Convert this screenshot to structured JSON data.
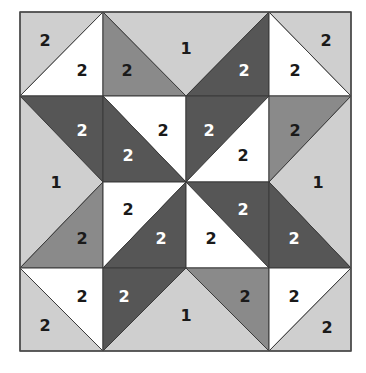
{
  "diagram": {
    "colors": {
      "light": "#cfcfcf",
      "white": "#ffffff",
      "medium": "#8a8a8a",
      "dark": "#565656",
      "text_dark": "#1a1a1a",
      "text_light": "#ffffff"
    },
    "grid": {
      "x": [
        20,
        103,
        186,
        269,
        351
      ],
      "y": [
        12,
        96,
        182,
        268,
        351
      ]
    },
    "pieces": [
      {
        "id": "tl-corner-light",
        "tone": "light",
        "points": "20,12 103,12 20,96",
        "label": "2",
        "lx": 45,
        "ly": 40
      },
      {
        "id": "tl-corner-white",
        "tone": "white",
        "points": "103,12 103,96 20,96",
        "label": "2",
        "lx": 82,
        "ly": 70
      },
      {
        "id": "top-mid-medium",
        "tone": "medium",
        "points": "103,12 103,96 186,96",
        "label": "2",
        "lx": 127,
        "ly": 70
      },
      {
        "id": "top-mid-light",
        "tone": "light",
        "points": "103,12 269,12 186,96",
        "label": "1",
        "lx": 186,
        "ly": 48
      },
      {
        "id": "top-mid-dark",
        "tone": "dark",
        "points": "269,12 269,96 186,96",
        "label": "2",
        "lx": 244,
        "ly": 70
      },
      {
        "id": "tr-corner-white",
        "tone": "white",
        "points": "269,12 269,96 351,96",
        "label": "2",
        "lx": 295,
        "ly": 70
      },
      {
        "id": "tr-corner-light",
        "tone": "light",
        "points": "269,12 351,12 351,96",
        "label": "2",
        "lx": 326,
        "ly": 40
      },
      {
        "id": "left-mid-dark",
        "tone": "dark",
        "points": "20,96 103,96 103,182",
        "label": "2",
        "lx": 82,
        "ly": 130
      },
      {
        "id": "left-mid-light",
        "tone": "light",
        "points": "20,96 103,182 20,268",
        "label": "1",
        "lx": 56,
        "ly": 182
      },
      {
        "id": "left-mid-medium",
        "tone": "medium",
        "points": "103,182 103,268 20,268",
        "label": "2",
        "lx": 82,
        "ly": 238
      },
      {
        "id": "center-r1c1-white",
        "tone": "white",
        "points": "103,96 186,96 186,182",
        "label": "2",
        "lx": 163,
        "ly": 130
      },
      {
        "id": "center-r1c1-dark",
        "tone": "dark",
        "points": "103,96 186,182 103,182",
        "label": "2",
        "lx": 128,
        "ly": 155
      },
      {
        "id": "center-r1c2-dark",
        "tone": "dark",
        "points": "186,96 269,96 186,182",
        "label": "2",
        "lx": 209,
        "ly": 130
      },
      {
        "id": "center-r1c2-white",
        "tone": "white",
        "points": "269,96 269,182 186,182",
        "label": "2",
        "lx": 243,
        "ly": 155
      },
      {
        "id": "center-r2c1-white",
        "tone": "white",
        "points": "103,182 186,182 103,268",
        "label": "2",
        "lx": 128,
        "ly": 209
      },
      {
        "id": "center-r2c1-dark",
        "tone": "dark",
        "points": "186,182 186,268 103,268",
        "label": "2",
        "lx": 161,
        "ly": 238
      },
      {
        "id": "center-r2c2-dark",
        "tone": "dark",
        "points": "186,182 269,182 269,268",
        "label": "2",
        "lx": 243,
        "ly": 209
      },
      {
        "id": "center-r2c2-white",
        "tone": "white",
        "points": "186,182 269,268 186,268",
        "label": "2",
        "lx": 211,
        "ly": 238
      },
      {
        "id": "right-mid-medium",
        "tone": "medium",
        "points": "269,96 351,96 269,182",
        "label": "2",
        "lx": 295,
        "ly": 130
      },
      {
        "id": "right-mid-light",
        "tone": "light",
        "points": "351,96 351,268 269,182",
        "label": "1",
        "lx": 318,
        "ly": 182
      },
      {
        "id": "right-mid-dark",
        "tone": "dark",
        "points": "269,182 351,268 269,268",
        "label": "2",
        "lx": 294,
        "ly": 238
      },
      {
        "id": "bl-corner-white",
        "tone": "white",
        "points": "20,268 103,268 103,351",
        "label": "2",
        "lx": 82,
        "ly": 296
      },
      {
        "id": "bl-corner-light",
        "tone": "light",
        "points": "20,268 103,351 20,351",
        "label": "2",
        "lx": 45,
        "ly": 325
      },
      {
        "id": "bottom-mid-dark",
        "tone": "dark",
        "points": "103,268 186,268 103,351",
        "label": "2",
        "lx": 124,
        "ly": 296
      },
      {
        "id": "bottom-mid-light",
        "tone": "light",
        "points": "186,268 269,351 103,351",
        "label": "1",
        "lx": 186,
        "ly": 315
      },
      {
        "id": "bottom-mid-medium",
        "tone": "medium",
        "points": "186,268 269,268 269,351",
        "label": "2",
        "lx": 245,
        "ly": 296
      },
      {
        "id": "br-corner-white",
        "tone": "white",
        "points": "269,268 351,268 269,351",
        "label": "2",
        "lx": 294,
        "ly": 296
      },
      {
        "id": "br-corner-light",
        "tone": "light",
        "points": "351,268 351,351 269,351",
        "label": "2",
        "lx": 327,
        "ly": 327
      }
    ]
  }
}
